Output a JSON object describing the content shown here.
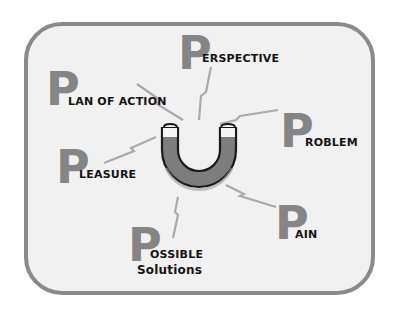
{
  "diagram": {
    "type": "hub-and-spoke",
    "center": {
      "shape": "horseshoe-magnet",
      "icon": "magnet-icon"
    },
    "letter": "P",
    "nodes": [
      {
        "id": "perspective",
        "big_letter": "P",
        "rest": "erspective",
        "full": "Perspective"
      },
      {
        "id": "plan-of-action",
        "big_letter": "P",
        "rest": "lan of Action",
        "full": "Plan of Action"
      },
      {
        "id": "problem",
        "big_letter": "P",
        "rest": "roblem",
        "full": "Problem"
      },
      {
        "id": "pleasure",
        "big_letter": "P",
        "rest": "leasure",
        "full": "Pleasure"
      },
      {
        "id": "possible-solutions",
        "big_letter": "P",
        "rest_line1": "ossible",
        "rest_line2": "Solutions",
        "full": "Possible Solutions"
      },
      {
        "id": "pain",
        "big_letter": "P",
        "rest": "ain",
        "full": "Pain"
      }
    ],
    "connectors": "lightning-bolt",
    "colors": {
      "frame_border": "#8a8a8a",
      "frame_fill": "#f1f1f1",
      "big_letter": "#858585",
      "text": "#141414",
      "magnet_body": "#7d7d7d",
      "magnet_tips": "#f4f4f4",
      "bolt": "#a9a9a9"
    }
  }
}
